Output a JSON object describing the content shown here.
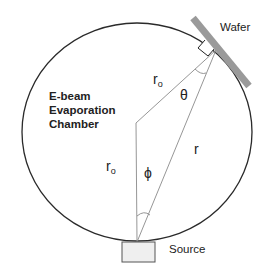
{
  "diagram": {
    "chamber_label": [
      "E-beam",
      "Evaporation",
      "Chamber"
    ],
    "wafer_label": "Wafer",
    "source_label": "Source",
    "symbols": {
      "r0_top": "r",
      "r0_top_sub": "o",
      "r0_left": "r",
      "r0_left_sub": "o",
      "r": "r",
      "theta": "θ",
      "phi": "ϕ"
    },
    "colors": {
      "circle": "#2a2a2a",
      "lines": "#888888",
      "wafer": "#999999",
      "source_fill": "#efefef",
      "source_stroke": "#555555"
    }
  }
}
